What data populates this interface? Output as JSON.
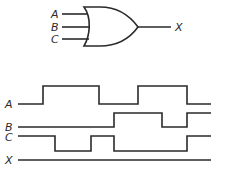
{
  "gate": {
    "type": "OR",
    "inputs": [
      {
        "label": "A",
        "y": 14
      },
      {
        "label": "B",
        "y": 27
      },
      {
        "label": "C",
        "y": 39
      }
    ],
    "output": {
      "label": "X",
      "y": 27
    }
  },
  "timing": {
    "signals": [
      {
        "label": "A",
        "levels": "0 1 0 1 0",
        "transitions": [
          43,
          99,
          138,
          187
        ],
        "start_level": 0
      },
      {
        "label": "B",
        "levels": "0 1 0 1",
        "transitions": [
          114,
          162,
          187
        ],
        "start_level": 0
      },
      {
        "label": "C",
        "levels": "1 0 1 0 1",
        "transitions": [
          55,
          91,
          114,
          187
        ],
        "start_level": 1
      },
      {
        "label": "X",
        "levels": "constant",
        "transitions": [],
        "start_level": 0
      }
    ]
  },
  "colors": {
    "ink": "#2a2a2a",
    "background": "#ffffff"
  }
}
